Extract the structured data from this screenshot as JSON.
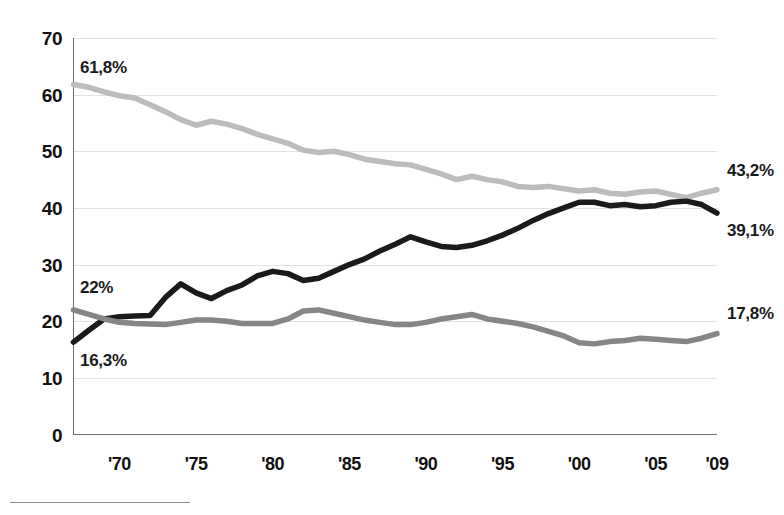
{
  "chart_data": {
    "type": "line",
    "title": "",
    "subtitle": "",
    "xlabel": "",
    "ylabel": "",
    "xlim": [
      1967,
      2009
    ],
    "ylim": [
      0,
      70
    ],
    "grid": true,
    "legend": "none",
    "y_ticks": [
      0,
      10,
      20,
      30,
      40,
      50,
      60,
      70
    ],
    "y_tick_labels": [
      "0",
      "10",
      "20",
      "30",
      "40",
      "50",
      "60",
      "70"
    ],
    "x_ticks": [
      1970,
      1975,
      1980,
      1985,
      1990,
      1995,
      2000,
      2005,
      2009
    ],
    "x_tick_labels": [
      "'70",
      "'75",
      "'80",
      "'85",
      "'90",
      "'95",
      "'00",
      "'05",
      "'09"
    ],
    "x": [
      1967,
      1968,
      1969,
      1970,
      1971,
      1972,
      1973,
      1974,
      1975,
      1976,
      1977,
      1978,
      1979,
      1980,
      1981,
      1982,
      1983,
      1984,
      1985,
      1986,
      1987,
      1988,
      1989,
      1990,
      1991,
      1992,
      1993,
      1994,
      1995,
      1996,
      1997,
      1998,
      1999,
      2000,
      2001,
      2002,
      2003,
      2004,
      2005,
      2006,
      2007,
      2008,
      2009
    ],
    "series": [
      {
        "name": "series-light-gray",
        "color": "#bcbcbc",
        "stroke_width": 5.5,
        "start_label": "61,8%",
        "end_label": "43,2%",
        "values": [
          61.8,
          61.3,
          60.5,
          59.8,
          59.4,
          58.2,
          57.0,
          55.6,
          54.6,
          55.3,
          54.8,
          54.0,
          53.0,
          52.2,
          51.4,
          50.2,
          49.8,
          50.0,
          49.4,
          48.6,
          48.2,
          47.8,
          47.6,
          46.8,
          46.0,
          45.0,
          45.6,
          45.0,
          44.6,
          43.8,
          43.6,
          43.8,
          43.4,
          43.0,
          43.2,
          42.6,
          42.4,
          42.8,
          43.0,
          42.4,
          41.8,
          42.6,
          43.2
        ]
      },
      {
        "name": "series-black",
        "color": "#1a1a1a",
        "stroke_width": 5.5,
        "start_label": "16,3%",
        "end_label": "39,1%",
        "values": [
          16.3,
          18.4,
          20.4,
          20.8,
          20.9,
          21.0,
          24.2,
          26.6,
          25.0,
          24.0,
          25.4,
          26.4,
          28.0,
          28.8,
          28.4,
          27.2,
          27.6,
          28.8,
          30.0,
          31.0,
          32.4,
          33.6,
          34.9,
          34.0,
          33.2,
          33.0,
          33.4,
          34.2,
          35.2,
          36.4,
          37.8,
          39.0,
          40.0,
          41.0,
          41.0,
          40.4,
          40.6,
          40.2,
          40.4,
          41.0,
          41.2,
          40.6,
          39.1
        ]
      },
      {
        "name": "series-mid-gray",
        "color": "#868686",
        "stroke_width": 5.5,
        "start_label": "22%",
        "end_label": "17,8%",
        "values": [
          22.0,
          21.2,
          20.4,
          19.8,
          19.6,
          19.5,
          19.4,
          19.8,
          20.2,
          20.2,
          20.0,
          19.6,
          19.6,
          19.6,
          20.4,
          21.8,
          22.0,
          21.4,
          20.8,
          20.2,
          19.8,
          19.4,
          19.4,
          19.8,
          20.4,
          20.8,
          21.2,
          20.4,
          20.0,
          19.6,
          19.0,
          18.2,
          17.4,
          16.2,
          16.0,
          16.4,
          16.6,
          17.0,
          16.8,
          16.6,
          16.4,
          17.0,
          17.8
        ]
      }
    ],
    "annotations": [
      {
        "name": "annotation-top-start",
        "text": "61,8%",
        "series": "series-light-gray",
        "position": "start"
      },
      {
        "name": "annotation-top-end",
        "text": "43,2%",
        "series": "series-light-gray",
        "position": "end"
      },
      {
        "name": "annotation-black-start",
        "text": "16,3%",
        "series": "series-black",
        "position": "start"
      },
      {
        "name": "annotation-black-end",
        "text": "39,1%",
        "series": "series-black",
        "position": "end"
      },
      {
        "name": "annotation-mid-start",
        "text": "22%",
        "series": "series-mid-gray",
        "position": "start"
      },
      {
        "name": "annotation-mid-end",
        "text": "17,8%",
        "series": "series-mid-gray",
        "position": "end"
      }
    ]
  },
  "colors": {
    "background": "#ffffff",
    "axis": "#6f6f6f",
    "gridline": "#e2e2e2",
    "text": "#111111",
    "series_light_gray": "#bcbcbc",
    "series_mid_gray": "#868686",
    "series_black": "#1a1a1a",
    "footnote_rule": "#8d8d8d"
  }
}
